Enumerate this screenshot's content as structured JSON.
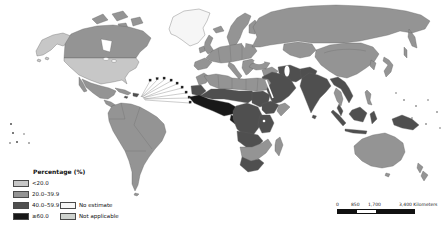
{
  "map_figure": {
    "legend": {
      "title": "Percentage (%)",
      "class_colors": {
        "lt20": "#c7c7c7",
        "c20_39": "#949494",
        "c40_59": "#4f4f4f",
        "ge60": "#181818",
        "no_estimate": "#f6f6f6",
        "not_applicable": "#ced2ce"
      },
      "items": [
        {
          "key": "lt20",
          "label": "<20.0"
        },
        {
          "key": "c20_39",
          "label": "20.0–39.9"
        },
        {
          "key": "c40_59",
          "label": "40.0–59.9"
        },
        {
          "key": "ge60",
          "label": "≥60.0"
        },
        {
          "key": "no_estimate",
          "label": "No estimate"
        },
        {
          "key": "not_applicable",
          "label": "Not applicable"
        }
      ]
    },
    "scalebar": {
      "tick_labels": [
        "0",
        "850",
        "1,700"
      ],
      "end_label": "3,400 Kilometers"
    },
    "regions": {
      "alaska": "lt20",
      "canada": "c20_39",
      "usa": "lt20",
      "greenland": "no_estimate",
      "arctic-islands": "c20_39",
      "mexico": "c20_39",
      "central-america": "c20_39",
      "cuba": "c20_39",
      "hispaniola": "c40_59",
      "caribbean-markers": "ge60",
      "south-america": "c20_39",
      "iceland": "c20_39",
      "uk": "c20_39",
      "ireland": "c20_39",
      "scandinavia": "c20_39",
      "finland": "c20_39",
      "western-europe": "c20_39",
      "iberia": "c20_39",
      "italy": "c20_39",
      "balkans": "c20_39",
      "russia": "c20_39",
      "central-asia": "c20_39",
      "turkey": "c20_39",
      "levant": "c20_39",
      "arabia": "c40_59",
      "iran": "c40_59",
      "afghanistan-pakistan": "c40_59",
      "india": "c40_59",
      "sri-lanka": "c40_59",
      "china": "c20_39",
      "korea": "c20_39",
      "japan": "c20_39",
      "indochina": "c40_59",
      "thailand": "c20_39",
      "malay-peninsula": "c40_59",
      "philippines": "c20_39",
      "sumatra": "c40_59",
      "java": "c40_59",
      "borneo": "c40_59",
      "sulawesi": "c40_59",
      "new-guinea": "c40_59",
      "australia": "c20_39",
      "tasmania": "c20_39",
      "new-zealand": "c20_39",
      "morocco": "c20_39",
      "north-africa": "c20_39",
      "mauritania": "c40_59",
      "sahel": "c40_59",
      "sudan": "c40_59",
      "west-africa": "ge60",
      "gabon": "ge60",
      "central-africa": "c40_59",
      "ethiopia": "c40_59",
      "somalia": "c20_39",
      "east-africa": "c40_59",
      "angola-zambia": "c40_59",
      "southern-africa": "c20_39",
      "south-africa": "c40_59",
      "madagascar": "c20_39",
      "pacific-islands": "c40_59"
    }
  }
}
